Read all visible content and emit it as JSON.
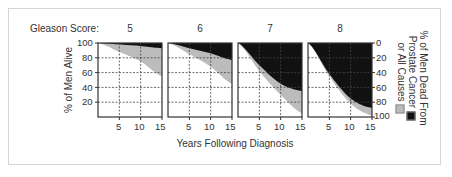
{
  "labels": {
    "gleason": "Gleason Score:",
    "ylabel_left": "% of Men Alive",
    "xlabel": "Years Following Diagnosis",
    "ylabel_right_line1": "% of Men Dead From",
    "ylabel_right_line2": "Prostate Cancer",
    "ylabel_right_line3": "or All Causes"
  },
  "colors": {
    "prostate_cancer": "#111111",
    "all_causes": "#bcbcbc",
    "alive": "#ffffff",
    "grid": "#444444",
    "axis": "#333333"
  },
  "ticks": {
    "left_y": [
      "100",
      "80",
      "60",
      "40",
      "20"
    ],
    "right_y": [
      "0",
      "20",
      "40",
      "60",
      "80",
      "100"
    ],
    "x": [
      "5",
      "10",
      "15"
    ]
  },
  "chart_data": [
    {
      "type": "area",
      "title": "5",
      "xlabel": "Years Following Diagnosis",
      "ylabel": "% of Men Alive",
      "x": [
        0,
        5,
        10,
        15
      ],
      "series": [
        {
          "name": "Alive",
          "values": [
            100,
            88,
            75,
            55
          ]
        },
        {
          "name": "Alive + Dead of other causes (boundary below prostate cancer deaths)",
          "values": [
            100,
            98,
            96,
            93
          ]
        }
      ],
      "xlim": [
        0,
        15
      ],
      "ylim": [
        0,
        100
      ],
      "grid": true
    },
    {
      "type": "area",
      "title": "6",
      "x": [
        0,
        5,
        10,
        15
      ],
      "series": [
        {
          "name": "Alive",
          "values": [
            100,
            85,
            68,
            45
          ]
        },
        {
          "name": "Alive + Dead of other causes",
          "values": [
            100,
            93,
            86,
            77
          ]
        }
      ],
      "xlim": [
        0,
        15
      ],
      "ylim": [
        0,
        100
      ],
      "grid": true
    },
    {
      "type": "area",
      "title": "7",
      "x": [
        0,
        5,
        10,
        15
      ],
      "series": [
        {
          "name": "Alive",
          "values": [
            100,
            62,
            30,
            5
          ]
        },
        {
          "name": "Alive + Dead of other causes",
          "values": [
            100,
            70,
            45,
            35
          ]
        }
      ],
      "xlim": [
        0,
        15
      ],
      "ylim": [
        0,
        100
      ],
      "grid": true
    },
    {
      "type": "area",
      "title": "8",
      "x": [
        0,
        5,
        10,
        15
      ],
      "series": [
        {
          "name": "Alive",
          "values": [
            100,
            55,
            18,
            2
          ]
        },
        {
          "name": "Alive + Dead of other causes",
          "values": [
            100,
            58,
            25,
            12
          ]
        }
      ],
      "xlim": [
        0,
        15
      ],
      "ylim": [
        0,
        100
      ],
      "grid": true
    }
  ],
  "legend": [
    {
      "label": "Prostate Cancer",
      "color": "#111111"
    },
    {
      "label": "All Causes",
      "color": "#bcbcbc"
    }
  ]
}
